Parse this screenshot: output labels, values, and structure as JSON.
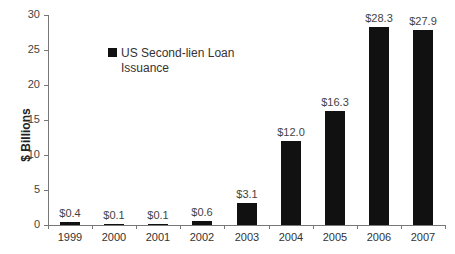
{
  "chart_data": {
    "type": "bar",
    "title": "",
    "xlabel": "",
    "ylabel": "$ Billions",
    "ylim": [
      0,
      30
    ],
    "yticks": [
      0,
      5,
      10,
      15,
      20,
      25,
      30
    ],
    "categories": [
      "1999",
      "2000",
      "2001",
      "2002",
      "2003",
      "2004",
      "2005",
      "2006",
      "2007"
    ],
    "series": [
      {
        "name": "US Second-lien Loan Issuance",
        "values": [
          0.4,
          0.1,
          0.1,
          0.6,
          3.1,
          12.0,
          16.3,
          28.3,
          27.9
        ],
        "labels": [
          "$0.4",
          "$0.1",
          "$0.1",
          "$0.6",
          "$3.1",
          "$12.0",
          "$16.3",
          "$28.3",
          "$27.9"
        ],
        "color": "#111111"
      }
    ],
    "legend": {
      "position": "upper-left-inside",
      "entries": [
        "US Second-lien Loan Issuance"
      ]
    },
    "grid": false
  },
  "axis": {
    "ylabel": "$ Billions"
  },
  "legend": {
    "label": "US Second-lien Loan Issuance"
  }
}
